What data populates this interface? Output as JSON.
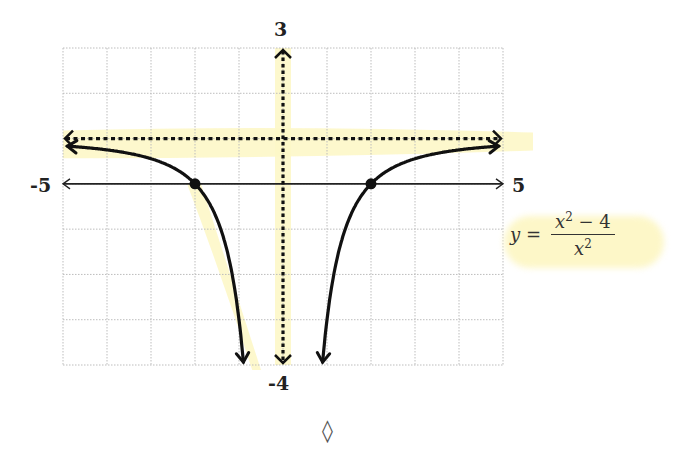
{
  "chart_data": {
    "type": "line",
    "title": "",
    "equation": {
      "lhs": "y =",
      "numerator": "x² − 4",
      "denominator": "x²"
    },
    "xlabel": "",
    "ylabel": "",
    "xlim": [
      -5,
      5
    ],
    "ylim": [
      -4,
      3
    ],
    "x_tick_labels": {
      "min": "-5",
      "max": "5"
    },
    "y_tick_labels": {
      "min": "-4",
      "max": "3"
    },
    "grid": true,
    "grid_spacing": {
      "x": 1,
      "y": 1
    },
    "asymptotes": [
      {
        "type": "horizontal",
        "y": 1,
        "style": "dashed"
      },
      {
        "type": "vertical",
        "x": 0,
        "style": "dashed"
      }
    ],
    "points": [
      {
        "x": -2,
        "y": 0,
        "label": "x-intercept"
      },
      {
        "x": 2,
        "y": 0,
        "label": "x-intercept"
      }
    ],
    "series": [
      {
        "name": "left branch",
        "function": "(x^2-4)/x^2",
        "x_range": [
          -4.9,
          -0.9
        ],
        "values_sample": [
          [
            -4.9,
            0.83
          ],
          [
            -4,
            0.75
          ],
          [
            -3,
            0.56
          ],
          [
            -2,
            0
          ],
          [
            -1.5,
            -0.78
          ],
          [
            -1.2,
            -1.78
          ],
          [
            -1,
            -3
          ],
          [
            -0.9,
            -3.94
          ]
        ]
      },
      {
        "name": "right branch",
        "function": "(x^2-4)/x^2",
        "x_range": [
          0.9,
          4.9
        ],
        "values_sample": [
          [
            0.9,
            -3.94
          ],
          [
            1,
            -3
          ],
          [
            1.2,
            -1.78
          ],
          [
            1.5,
            -0.78
          ],
          [
            2,
            0
          ],
          [
            3,
            0.56
          ],
          [
            4,
            0.75
          ],
          [
            4.9,
            0.83
          ]
        ]
      }
    ]
  },
  "labels": {
    "x_min": "-5",
    "x_max": "5",
    "y_max": "3",
    "y_min": "-4",
    "eq_lhs": "y =",
    "eq_num_base": "x",
    "eq_num_exp": "2",
    "eq_num_rest": " − 4",
    "eq_den_base": "x",
    "eq_den_exp": "2",
    "footer_symbol": "◊"
  },
  "colors": {
    "curve": "#111111",
    "grid": "#bdbdbd",
    "highlight": "#fdf7c8"
  }
}
